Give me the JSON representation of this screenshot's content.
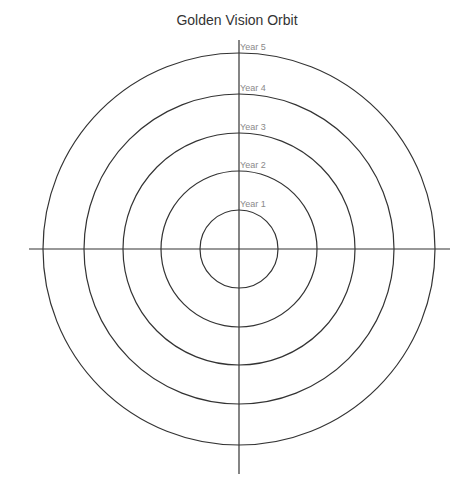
{
  "title": "Golden Vision Orbit",
  "diagram": {
    "type": "concentric-orbit",
    "center": {
      "x": 239,
      "y": 249
    },
    "rings": [
      {
        "label": "Year 1",
        "radius": 39
      },
      {
        "label": "Year 2",
        "radius": 78
      },
      {
        "label": "Year 3",
        "radius": 116
      },
      {
        "label": "Year 4",
        "radius": 155
      },
      {
        "label": "Year 5",
        "radius": 196
      }
    ],
    "axes": {
      "horizontal": {
        "x1": 29,
        "x2": 450
      },
      "vertical": {
        "y1": 40,
        "y2": 474
      }
    },
    "line_color": "#333333",
    "label_color": "#8a8a8a"
  }
}
